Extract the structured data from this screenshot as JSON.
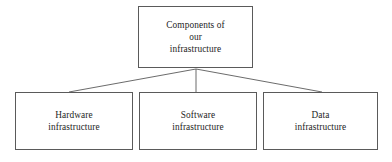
{
  "diagram": {
    "type": "org-hierarchy",
    "title": "Components of our infrastructure",
    "background_color": "#ffffff",
    "stroke_color": "#5a5a5a",
    "text_color": "#1d1d1d",
    "root": {
      "id": "root",
      "label": "Components of\nour\ninfrastructure"
    },
    "children": [
      {
        "id": "hardware",
        "label": "Hardware\ninfrastructure"
      },
      {
        "id": "software",
        "label": "Software\ninfrastructure"
      },
      {
        "id": "data",
        "label": "Data\ninfrastructure"
      }
    ]
  }
}
